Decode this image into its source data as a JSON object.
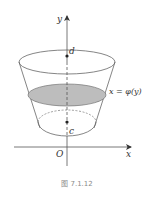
{
  "figure": {
    "caption": "图 7.1.12",
    "labels": {
      "y_axis": "y",
      "x_axis": "x",
      "origin": "O",
      "top_point": "d",
      "bottom_point": "c",
      "curve": "x = φ(y)"
    },
    "colors": {
      "line": "#555555",
      "cross_section_fill": "#bdbdbd",
      "caption": "#8a8a8a",
      "background": "#ffffff"
    }
  }
}
